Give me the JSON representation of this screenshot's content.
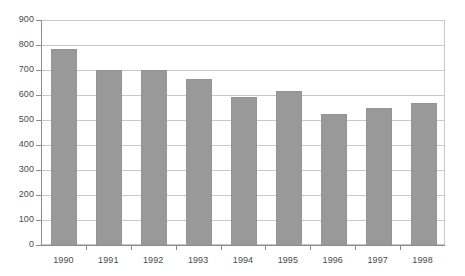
{
  "chart_data": {
    "type": "bar",
    "title": "",
    "subtitle": "",
    "xlabel": "",
    "ylabel": "",
    "categories": [
      "1990",
      "1991",
      "1992",
      "1993",
      "1994",
      "1995",
      "1996",
      "1997",
      "1998"
    ],
    "values": [
      790,
      705,
      705,
      668,
      597,
      620,
      528,
      552,
      572
    ],
    "ylim": [
      0,
      900
    ],
    "y_ticks": [
      0,
      100,
      200,
      300,
      400,
      500,
      600,
      700,
      800,
      900
    ],
    "y_tick_labels": [
      "0",
      "100",
      "200",
      "300",
      "400",
      "500",
      "600",
      "700",
      "800",
      "900"
    ],
    "grid": true,
    "grid_axis": "y",
    "legend": false,
    "legend_position": "none",
    "series": [
      {
        "name": "",
        "values": [
          790,
          705,
          705,
          668,
          597,
          620,
          528,
          552,
          572
        ],
        "color": "#999999"
      }
    ],
    "colors": {
      "bar_fill": "#999999",
      "bar_border": "#949494",
      "gridline": "#c8c8c8",
      "axis_line": "#8c8c8c",
      "plot_background": "#ffffff",
      "tick_label": "#4a4a4a",
      "page_background": "#ffffff"
    }
  }
}
